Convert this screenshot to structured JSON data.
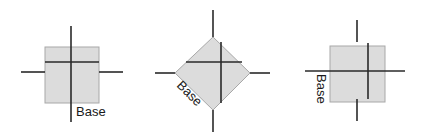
{
  "figures": [
    {
      "id": "upright-square",
      "label": "Base",
      "orientation": "upright"
    },
    {
      "id": "diamond",
      "label": "Base",
      "orientation": "rotated-45"
    },
    {
      "id": "sideways-square",
      "label": "Base",
      "orientation": "rotated-90"
    }
  ],
  "colors": {
    "fill": "#dcdcdc",
    "outline": "#a8a8a8",
    "line": "#2a2a2a"
  }
}
